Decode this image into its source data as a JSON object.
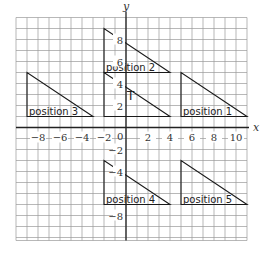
{
  "diagram": {
    "type": "coordinate-grid-transformations",
    "axes": {
      "x_label": "x",
      "y_label": "y",
      "origin_label": "0",
      "x_range": [
        -10,
        11
      ],
      "y_range": [
        -10,
        10
      ],
      "x_ticks": [
        {
          "value": -8,
          "label": "-8"
        },
        {
          "value": -6,
          "label": "-6"
        },
        {
          "value": -4,
          "label": "-4"
        },
        {
          "value": -2,
          "label": "-2"
        },
        {
          "value": 2,
          "label": "2"
        },
        {
          "value": 4,
          "label": "4"
        },
        {
          "value": 6,
          "label": "6"
        },
        {
          "value": 8,
          "label": "8"
        },
        {
          "value": 10,
          "label": "10"
        }
      ],
      "y_ticks": [
        {
          "value": 8,
          "label": "8"
        },
        {
          "value": 6,
          "label": "6"
        },
        {
          "value": 4,
          "label": "4"
        },
        {
          "value": 2,
          "label": "2"
        },
        {
          "value": -2,
          "label": "-2"
        },
        {
          "value": -4,
          "label": "-4"
        },
        {
          "value": -8,
          "label": "-8"
        }
      ]
    },
    "shapes": [
      {
        "id": "T",
        "label": "T",
        "vertices": [
          [
            -2,
            1
          ],
          [
            -2,
            5
          ],
          [
            4,
            1
          ]
        ]
      },
      {
        "id": "position-1",
        "label": "position 1",
        "vertices": [
          [
            5,
            1
          ],
          [
            5,
            5
          ],
          [
            11,
            1
          ]
        ]
      },
      {
        "id": "position-2",
        "label": "position 2",
        "vertices": [
          [
            -2,
            5
          ],
          [
            -2,
            9
          ],
          [
            4,
            5
          ]
        ]
      },
      {
        "id": "position-3",
        "label": "position 3",
        "vertices": [
          [
            -9,
            1
          ],
          [
            -9,
            5
          ],
          [
            -3,
            1
          ]
        ]
      },
      {
        "id": "position-4",
        "label": "position 4",
        "vertices": [
          [
            -2,
            -7
          ],
          [
            -2,
            -3
          ],
          [
            4,
            -7
          ]
        ]
      },
      {
        "id": "position-5",
        "label": "position 5",
        "vertices": [
          [
            5,
            -7
          ],
          [
            5,
            -3
          ],
          [
            11,
            -7
          ]
        ]
      }
    ]
  }
}
